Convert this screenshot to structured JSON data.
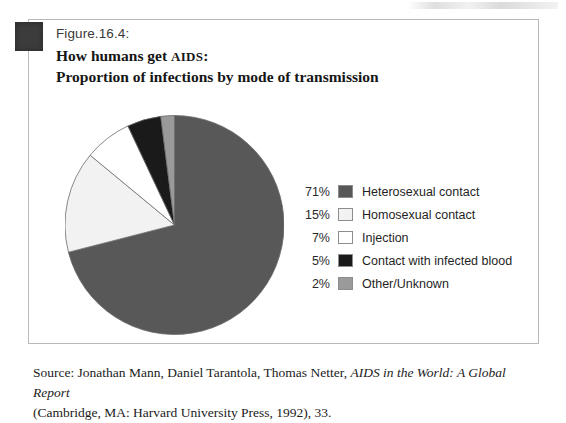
{
  "figure": {
    "label": "Figure.16.4:",
    "title_line1_prefix": "How humans get ",
    "title_line1_smallcaps": "AIDS",
    "title_line1_suffix": ":",
    "title_line2": "Proportion of infections by mode of transmission",
    "corner_marker_color": "#3c3c3c",
    "border_color": "#b9b9b9"
  },
  "chart_data": {
    "type": "pie",
    "categories": [
      "Heterosexual contact",
      "Homosexual contact",
      "Injection",
      "Contact with infected blood",
      "Other/Unknown"
    ],
    "values": [
      71,
      15,
      7,
      5,
      2
    ],
    "value_labels": [
      "71%",
      "15%",
      "7%",
      "5%",
      "2%"
    ],
    "unit": "%",
    "colors": [
      "#585858",
      "#f2f2f2",
      "#ffffff",
      "#1a1a1a",
      "#9a9a9a"
    ],
    "start_angle_deg": 0,
    "direction": "clockwise",
    "legend_position": "right",
    "grid": false
  },
  "legend": {
    "rows": [
      {
        "pct": "71%",
        "label": "Heterosexual contact",
        "color": "#585858"
      },
      {
        "pct": "15%",
        "label": "Homosexual contact",
        "color": "#f2f2f2"
      },
      {
        "pct": "7%",
        "label": "Injection",
        "color": "#ffffff"
      },
      {
        "pct": "5%",
        "label": "Contact with infected blood",
        "color": "#1a1a1a"
      },
      {
        "pct": "2%",
        "label": "Other/Unknown",
        "color": "#9a9a9a"
      }
    ]
  },
  "source": {
    "line1_prefix": "Source: Jonathan Mann, Daniel Tarantola, Thomas Netter, ",
    "line1_italic": "AIDS in the World: A Global Report",
    "line2": "(Cambridge, MA: Harvard University Press, 1992), 33."
  }
}
